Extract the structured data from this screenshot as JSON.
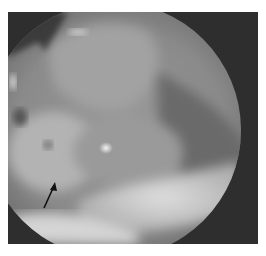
{
  "image": {
    "kind": "grayscale endoscopic photograph",
    "colors": {
      "background": "#ffffff",
      "outer_dark": "#2e2e2e",
      "tissue_mid": "#8a8a8a",
      "tissue_light": "#b8b8b8",
      "tissue_bright": "#d6d6d6",
      "arrow": "#111111"
    },
    "annotation": {
      "type": "arrow",
      "direction": "up-right",
      "tail": [
        44,
        208
      ],
      "head": [
        55,
        183
      ]
    }
  }
}
